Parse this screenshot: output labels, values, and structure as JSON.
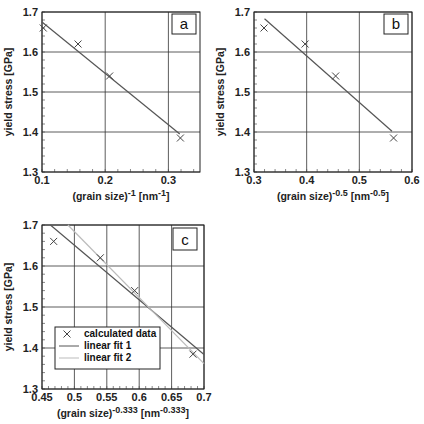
{
  "chart_data": [
    {
      "type": "scatter",
      "panel_label": "a",
      "xlabel": "(grain size)-1 [nm-1]",
      "xlabel_parts": {
        "base": "(grain size)",
        "exp": "-1",
        "unit_open": " [nm",
        "unit_exp": "-1",
        "unit_close": "]"
      },
      "ylabel": "yield stress [GPa]",
      "xlim": [
        0.1,
        0.35
      ],
      "ylim": [
        1.3,
        1.7
      ],
      "xticks": [
        0.1,
        0.2,
        0.3
      ],
      "xtick_labels": [
        "0.1",
        "0.2",
        "0.3"
      ],
      "yticks": [
        1.3,
        1.4,
        1.5,
        1.6,
        1.7
      ],
      "ytick_labels": [
        "1.3",
        "1.4",
        "1.5",
        "1.6",
        "1.7"
      ],
      "grid": true,
      "series": [
        {
          "name": "calculated data",
          "marker": "x",
          "x": [
            0.102,
            0.157,
            0.207,
            0.319
          ],
          "y": [
            1.66,
            1.62,
            1.54,
            1.385
          ]
        },
        {
          "name": "linear fit",
          "style": "line",
          "x": [
            0.1,
            0.318
          ],
          "y": [
            1.675,
            1.395
          ]
        }
      ]
    },
    {
      "type": "scatter",
      "panel_label": "b",
      "xlabel": "(grain size)-0.5 [nm-0.5]",
      "xlabel_parts": {
        "base": "(grain size)",
        "exp": "-0.5",
        "unit_open": " [nm",
        "unit_exp": "-0.5",
        "unit_close": "]"
      },
      "ylabel": "yield stress [GPa]",
      "xlim": [
        0.3,
        0.6
      ],
      "ylim": [
        1.3,
        1.7
      ],
      "xticks": [
        0.3,
        0.4,
        0.5,
        0.6
      ],
      "xtick_labels": [
        "0.3",
        "0.4",
        "0.5",
        "0.6"
      ],
      "yticks": [
        1.3,
        1.4,
        1.5,
        1.6,
        1.7
      ],
      "ytick_labels": [
        "1.3",
        "1.4",
        "1.5",
        "1.6",
        "1.7"
      ],
      "grid": true,
      "series": [
        {
          "name": "calculated data",
          "marker": "x",
          "x": [
            0.319,
            0.397,
            0.455,
            0.565
          ],
          "y": [
            1.66,
            1.62,
            1.54,
            1.385
          ]
        },
        {
          "name": "linear fit",
          "style": "line",
          "x": [
            0.32,
            0.562
          ],
          "y": [
            1.683,
            1.402
          ]
        }
      ]
    },
    {
      "type": "scatter",
      "panel_label": "c",
      "xlabel": "(grain size)-0.333 [nm-0.333]",
      "xlabel_parts": {
        "base": "(grain size)",
        "exp": "-0.333",
        "unit_open": "  [nm",
        "unit_exp": "-0.333",
        "unit_close": "]"
      },
      "ylabel": "yield stress [GPa]",
      "xlim": [
        0.45,
        0.7
      ],
      "ylim": [
        1.3,
        1.7
      ],
      "xticks": [
        0.45,
        0.5,
        0.55,
        0.6,
        0.65,
        0.7
      ],
      "xtick_labels": [
        "0.45",
        "0.5",
        "0.55",
        "0.6",
        "0.65",
        "0.7"
      ],
      "yticks": [
        1.3,
        1.4,
        1.5,
        1.6,
        1.7
      ],
      "ytick_labels": [
        "1.3",
        "1.4",
        "1.5",
        "1.6",
        "1.7"
      ],
      "grid": true,
      "legend": {
        "position": "lower-left",
        "entries": [
          "calculated data",
          "linear fit 1",
          "linear fit 2"
        ]
      },
      "series": [
        {
          "name": "calculated data",
          "marker": "x",
          "x": [
            0.468,
            0.54,
            0.593,
            0.683
          ],
          "y": [
            1.66,
            1.62,
            1.54,
            1.385
          ]
        },
        {
          "name": "linear fit 1",
          "style": "line",
          "color": "#555555",
          "x": [
            0.463,
            0.7
          ],
          "y": [
            1.7,
            1.384
          ]
        },
        {
          "name": "linear fit 2",
          "style": "line",
          "color": "#bbbbbb",
          "x": [
            0.49,
            0.7
          ],
          "y": [
            1.7,
            1.362
          ]
        }
      ]
    }
  ]
}
